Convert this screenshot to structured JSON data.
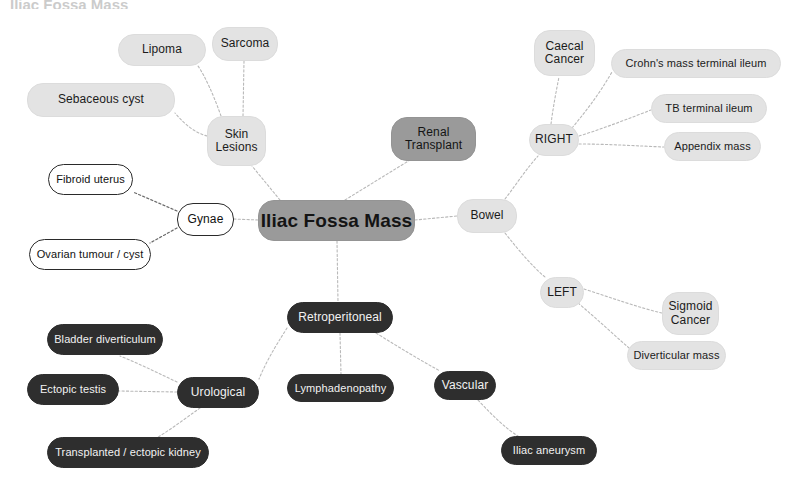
{
  "diagram": {
    "title": "Iliac Fossa Mass",
    "cropped_header_text": "Iliac Fossa Mass",
    "colors": {
      "light_fill": "#e3e3e3",
      "mid_fill": "#9a9a9a",
      "dark_fill": "#2e2e2e",
      "outline_stroke": "#2a2a2a",
      "edge_light": "#b9b9b9",
      "edge_dark": "#6a6a6a",
      "background": "#ffffff"
    },
    "center": {
      "label": "Iliac Fossa Mass",
      "style": "mid",
      "x": 258,
      "y": 200,
      "w": 157,
      "h": 41,
      "font": 19
    },
    "nodes": [
      {
        "id": "lipoma",
        "label": "Lipoma",
        "style": "light",
        "x": 118,
        "y": 34,
        "w": 88,
        "h": 32,
        "font": 12
      },
      {
        "id": "sarcoma",
        "label": "Sarcoma",
        "style": "light",
        "x": 212,
        "y": 27,
        "w": 66,
        "h": 34,
        "font": 12
      },
      {
        "id": "sebaceous",
        "label": "Sebaceous cyst",
        "style": "light",
        "x": 27,
        "y": 83,
        "w": 148,
        "h": 34,
        "font": 12
      },
      {
        "id": "skin",
        "label": "Skin\nLesions",
        "style": "light",
        "x": 207,
        "y": 116,
        "w": 59,
        "h": 50,
        "font": 12
      },
      {
        "id": "renal",
        "label": "Renal\nTransplant",
        "style": "mid",
        "x": 391,
        "y": 117,
        "w": 85,
        "h": 44,
        "font": 12
      },
      {
        "id": "fibroid",
        "label": "Fibroid uterus",
        "style": "outline",
        "x": 48,
        "y": 164,
        "w": 85,
        "h": 31,
        "font": 11
      },
      {
        "id": "gynae",
        "label": "Gynae",
        "style": "outline",
        "x": 177,
        "y": 203,
        "w": 57,
        "h": 33,
        "font": 12
      },
      {
        "id": "ovarian",
        "label": "Ovarian tumour / cyst",
        "style": "outline",
        "x": 29,
        "y": 239,
        "w": 122,
        "h": 31,
        "font": 11
      },
      {
        "id": "bowel",
        "label": "Bowel",
        "style": "light",
        "x": 457,
        "y": 199,
        "w": 60,
        "h": 34,
        "font": 12
      },
      {
        "id": "right",
        "label": "RIGHT",
        "style": "light",
        "x": 529,
        "y": 124,
        "w": 50,
        "h": 32,
        "font": 12
      },
      {
        "id": "caecal",
        "label": "Caecal\nCancer",
        "style": "light",
        "x": 534,
        "y": 30,
        "w": 61,
        "h": 46,
        "font": 12
      },
      {
        "id": "crohns",
        "label": "Crohn's mass terminal ileum",
        "style": "light",
        "x": 611,
        "y": 49,
        "w": 170,
        "h": 29,
        "font": 11
      },
      {
        "id": "tb",
        "label": "TB terminal ileum",
        "style": "light",
        "x": 651,
        "y": 94,
        "w": 116,
        "h": 29,
        "font": 11
      },
      {
        "id": "appendix",
        "label": "Appendix mass",
        "style": "light",
        "x": 664,
        "y": 132,
        "w": 97,
        "h": 29,
        "font": 11
      },
      {
        "id": "left",
        "label": "LEFT",
        "style": "light",
        "x": 540,
        "y": 277,
        "w": 44,
        "h": 31,
        "font": 12
      },
      {
        "id": "sigmoid",
        "label": "Sigmoid\nCancer",
        "style": "light",
        "x": 662,
        "y": 292,
        "w": 57,
        "h": 43,
        "font": 12
      },
      {
        "id": "diverticular",
        "label": "Diverticular mass",
        "style": "light",
        "x": 627,
        "y": 341,
        "w": 99,
        "h": 29,
        "font": 11
      },
      {
        "id": "retro",
        "label": "Retroperitoneal",
        "style": "dark",
        "x": 287,
        "y": 302,
        "w": 106,
        "h": 31,
        "font": 12
      },
      {
        "id": "bladder",
        "label": "Bladder diverticulum",
        "style": "dark",
        "x": 47,
        "y": 324,
        "w": 116,
        "h": 31,
        "font": 11
      },
      {
        "id": "ectopictestis",
        "label": "Ectopic testis",
        "style": "dark",
        "x": 27,
        "y": 374,
        "w": 92,
        "h": 31,
        "font": 11
      },
      {
        "id": "urological",
        "label": "Urological",
        "style": "dark",
        "x": 177,
        "y": 377,
        "w": 82,
        "h": 31,
        "font": 12
      },
      {
        "id": "transplanted",
        "label": "Transplanted / ectopic kidney",
        "style": "dark",
        "x": 47,
        "y": 437,
        "w": 162,
        "h": 31,
        "font": 11
      },
      {
        "id": "lymph",
        "label": "Lymphadenopathy",
        "style": "dark",
        "x": 287,
        "y": 374,
        "w": 107,
        "h": 28,
        "font": 11
      },
      {
        "id": "vascular",
        "label": "Vascular",
        "style": "dark",
        "x": 434,
        "y": 371,
        "w": 62,
        "h": 29,
        "font": 12
      },
      {
        "id": "iliac",
        "label": "Iliac aneurysm",
        "style": "dark",
        "x": 501,
        "y": 436,
        "w": 96,
        "h": 29,
        "font": 11
      }
    ],
    "edges": [
      {
        "from": "center",
        "to": "skin",
        "d": "M 280 200 L 252 166",
        "tone": "light"
      },
      {
        "from": "center",
        "to": "renal",
        "d": "M 345 200 L 410 160",
        "tone": "light"
      },
      {
        "from": "center",
        "to": "bowel",
        "d": "M 415 220 L 457 216",
        "tone": "light"
      },
      {
        "from": "center",
        "to": "gynae",
        "d": "M 258 220 L 234 219",
        "tone": "light"
      },
      {
        "from": "center",
        "to": "retro",
        "d": "M 337 241 L 338 302",
        "tone": "light"
      },
      {
        "from": "skin",
        "to": "lipoma",
        "d": "M 221 116 C 214 96 205 76 198 66",
        "tone": "light"
      },
      {
        "from": "skin",
        "to": "sarcoma",
        "d": "M 243 116 L 244 61",
        "tone": "light"
      },
      {
        "from": "skin",
        "to": "sebaceous",
        "d": "M 207 136 C 196 133 186 126 175 113",
        "tone": "light"
      },
      {
        "from": "gynae",
        "to": "fibroid",
        "d": "M 177 211 L 133 192",
        "tone": "dark"
      },
      {
        "from": "gynae",
        "to": "ovarian",
        "d": "M 177 228 L 150 243",
        "tone": "dark"
      },
      {
        "from": "bowel",
        "to": "right",
        "d": "M 505 199 C 518 182 527 168 538 156",
        "tone": "light"
      },
      {
        "from": "bowel",
        "to": "left",
        "d": "M 505 233 C 520 252 532 266 545 277",
        "tone": "light"
      },
      {
        "from": "right",
        "to": "caecal",
        "d": "M 551 124 C 553 108 556 92 559 77",
        "tone": "light"
      },
      {
        "from": "right",
        "to": "crohns",
        "d": "M 572 128 C 586 111 598 96 612 72",
        "tone": "light"
      },
      {
        "from": "right",
        "to": "tb",
        "d": "M 579 136 C 605 128 630 118 651 110",
        "tone": "light"
      },
      {
        "from": "right",
        "to": "appendix",
        "d": "M 579 144 C 608 144 638 146 664 147",
        "tone": "light"
      },
      {
        "from": "left",
        "to": "sigmoid",
        "d": "M 584 289 C 612 298 640 308 662 313",
        "tone": "light"
      },
      {
        "from": "left",
        "to": "diverticular",
        "d": "M 578 303 C 597 319 613 334 629 348",
        "tone": "light"
      },
      {
        "from": "retro",
        "to": "urological",
        "d": "M 287 328 C 281 338 268 357 259 379",
        "tone": "light"
      },
      {
        "from": "retro",
        "to": "lymph",
        "d": "M 340 333 L 341 374",
        "tone": "light"
      },
      {
        "from": "retro",
        "to": "vascular",
        "d": "M 376 333 C 400 348 420 360 440 371",
        "tone": "light"
      },
      {
        "from": "urological",
        "to": "bladder",
        "d": "M 177 382 C 160 374 140 364 120 356",
        "tone": "light"
      },
      {
        "from": "urological",
        "to": "ectopictestis",
        "d": "M 177 392 L 119 391",
        "tone": "light"
      },
      {
        "from": "urological",
        "to": "transplanted",
        "d": "M 200 408 C 186 418 170 430 155 439",
        "tone": "light"
      },
      {
        "from": "vascular",
        "to": "iliac",
        "d": "M 478 400 C 492 415 505 428 518 436",
        "tone": "light"
      }
    ]
  }
}
